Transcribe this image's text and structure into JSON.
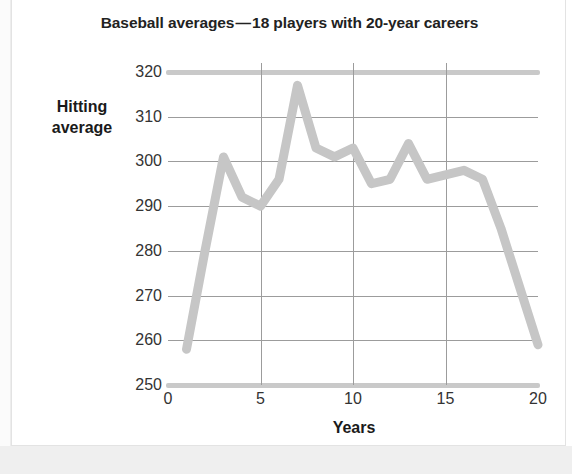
{
  "figure": {
    "title": "Baseball averages — 18 players with 20-year careers",
    "line_color": "#c6c6c6",
    "grid_color": "#9c9c9c",
    "axis_color": "#c9c9c9",
    "background": "#ffffff"
  },
  "chart_data": {
    "type": "line",
    "title": "Baseball averages — 18 players with 20-year careers",
    "xlabel": "Years",
    "ylabel": "Hitting average",
    "ylabel_line1": "Hitting",
    "ylabel_line2": "average",
    "x": [
      1,
      2,
      3,
      4,
      5,
      6,
      7,
      8,
      9,
      10,
      11,
      12,
      13,
      14,
      15,
      16,
      17,
      18,
      19,
      20
    ],
    "values": [
      258,
      280,
      301,
      292,
      290,
      296,
      317,
      303,
      301,
      303,
      295,
      296,
      304,
      296,
      297,
      298,
      296,
      285,
      272,
      259
    ],
    "series": [
      {
        "name": "Hitting average",
        "values": [
          258,
          280,
          301,
          292,
          290,
          296,
          317,
          303,
          301,
          303,
          295,
          296,
          304,
          296,
          297,
          298,
          296,
          285,
          272,
          259
        ]
      }
    ],
    "xlim": [
      0,
      20
    ],
    "ylim": [
      250,
      322
    ],
    "xticks": [
      0,
      5,
      10,
      15,
      20
    ],
    "xtick_labels": [
      "0",
      "5",
      "10",
      "15",
      "20"
    ],
    "yticks": [
      250,
      260,
      270,
      280,
      290,
      300,
      310,
      320
    ],
    "ytick_labels": [
      "250",
      "260",
      "270",
      "280",
      "290",
      "300",
      "310",
      "320"
    ],
    "grid": true,
    "grid_axes": "both",
    "legend": false,
    "legend_position": "none"
  }
}
